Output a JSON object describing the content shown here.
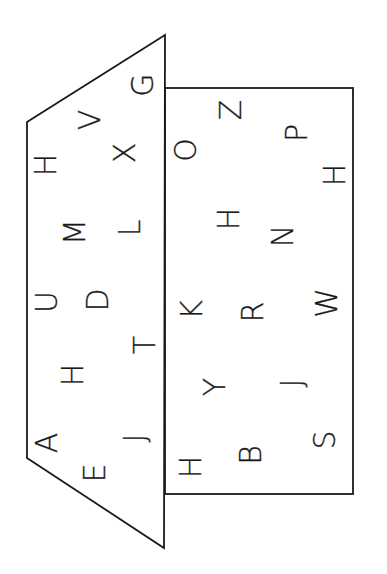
{
  "diagram": {
    "stroke_color": "#1a1a1a",
    "background": "#ffffff",
    "trapezoid": {
      "points": "165,35 27,122 27,458 164,548",
      "letters": [
        {
          "char": "G",
          "x": 143,
          "y": 85
        },
        {
          "char": "V",
          "x": 90,
          "y": 120
        },
        {
          "char": "H",
          "x": 46,
          "y": 165
        },
        {
          "char": "X",
          "x": 125,
          "y": 153
        },
        {
          "char": "M",
          "x": 75,
          "y": 232
        },
        {
          "char": "L",
          "x": 130,
          "y": 228
        },
        {
          "char": "U",
          "x": 47,
          "y": 302
        },
        {
          "char": "D",
          "x": 98,
          "y": 300
        },
        {
          "char": "T",
          "x": 145,
          "y": 345
        },
        {
          "char": "H",
          "x": 73,
          "y": 375
        },
        {
          "char": "A",
          "x": 47,
          "y": 443
        },
        {
          "char": "J",
          "x": 135,
          "y": 438
        },
        {
          "char": "E",
          "x": 95,
          "y": 473
        }
      ]
    },
    "rectangle": {
      "x": 165,
      "y": 88,
      "width": 188,
      "height": 406,
      "letters": [
        {
          "char": "Z",
          "x": 231,
          "y": 110
        },
        {
          "char": "O",
          "x": 186,
          "y": 150
        },
        {
          "char": "P",
          "x": 297,
          "y": 133
        },
        {
          "char": "H",
          "x": 335,
          "y": 175
        },
        {
          "char": "H",
          "x": 229,
          "y": 219
        },
        {
          "char": "N",
          "x": 283,
          "y": 236
        },
        {
          "char": "K",
          "x": 192,
          "y": 310
        },
        {
          "char": "R",
          "x": 253,
          "y": 312
        },
        {
          "char": "W",
          "x": 327,
          "y": 303
        },
        {
          "char": "Y",
          "x": 215,
          "y": 387
        },
        {
          "char": "J",
          "x": 292,
          "y": 383
        },
        {
          "char": "B",
          "x": 251,
          "y": 455
        },
        {
          "char": "S",
          "x": 325,
          "y": 440
        },
        {
          "char": "H",
          "x": 191,
          "y": 467
        }
      ]
    }
  }
}
